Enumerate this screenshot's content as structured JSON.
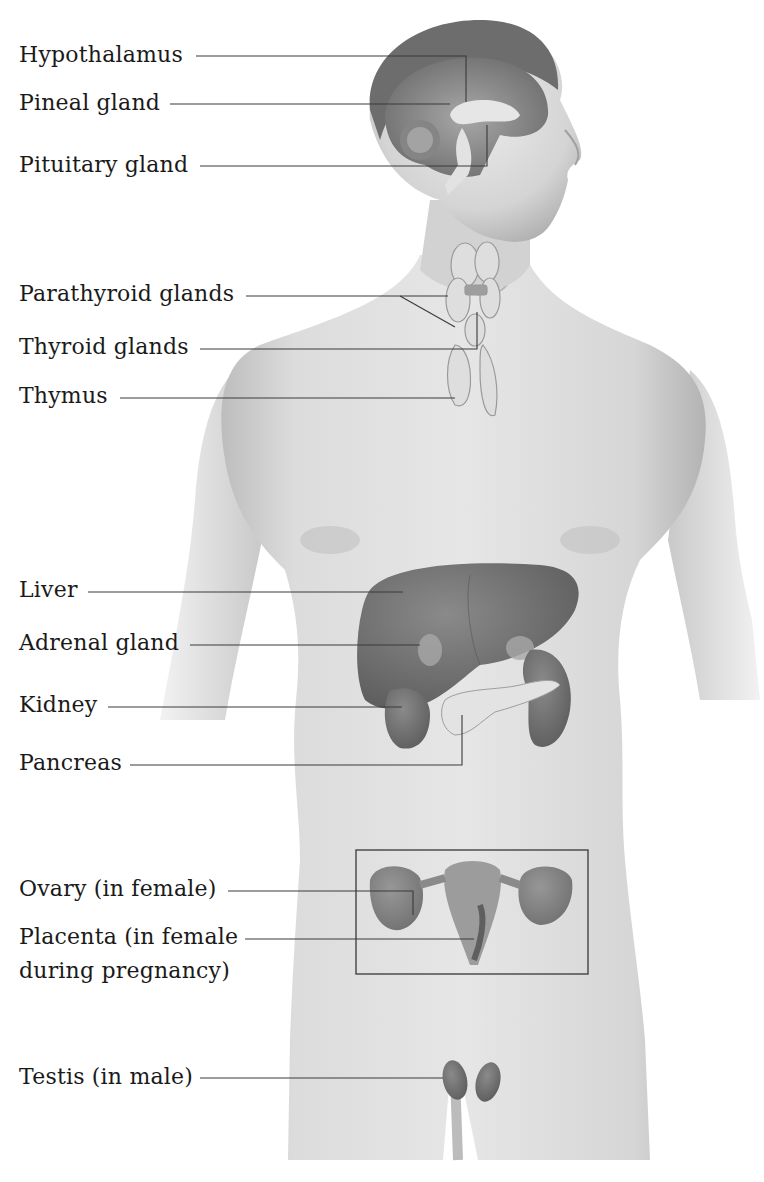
{
  "diagram": {
    "colors": {
      "background": "#ffffff",
      "skin": "#d9d9d9",
      "skin_shadow": "#b5b5b5",
      "organ_dark": "#6f6f6f",
      "organ_light": "#c8c8c8",
      "leader_line": "#3a3a3a",
      "text": "#1a1a1a"
    },
    "labels": [
      {
        "id": "hypothalamus",
        "text": "Hypothalamus"
      },
      {
        "id": "pineal",
        "text": "Pineal gland"
      },
      {
        "id": "pituitary",
        "text": "Pituitary gland"
      },
      {
        "id": "parathyroid",
        "text": "Parathyroid glands"
      },
      {
        "id": "thyroid",
        "text": "Thyroid glands"
      },
      {
        "id": "thymus",
        "text": "Thymus"
      },
      {
        "id": "liver",
        "text": "Liver"
      },
      {
        "id": "adrenal",
        "text": "Adrenal gland"
      },
      {
        "id": "kidney",
        "text": "Kidney"
      },
      {
        "id": "pancreas",
        "text": "Pancreas"
      },
      {
        "id": "ovary",
        "text": "Ovary (in female)"
      },
      {
        "id": "placenta",
        "text": "Placenta (in female during pregnancy)"
      },
      {
        "id": "testis",
        "text": "Testis (in male)"
      }
    ],
    "inset": {
      "name": "female-reproductive-inset",
      "contains": [
        "ovary",
        "uterus"
      ]
    }
  }
}
